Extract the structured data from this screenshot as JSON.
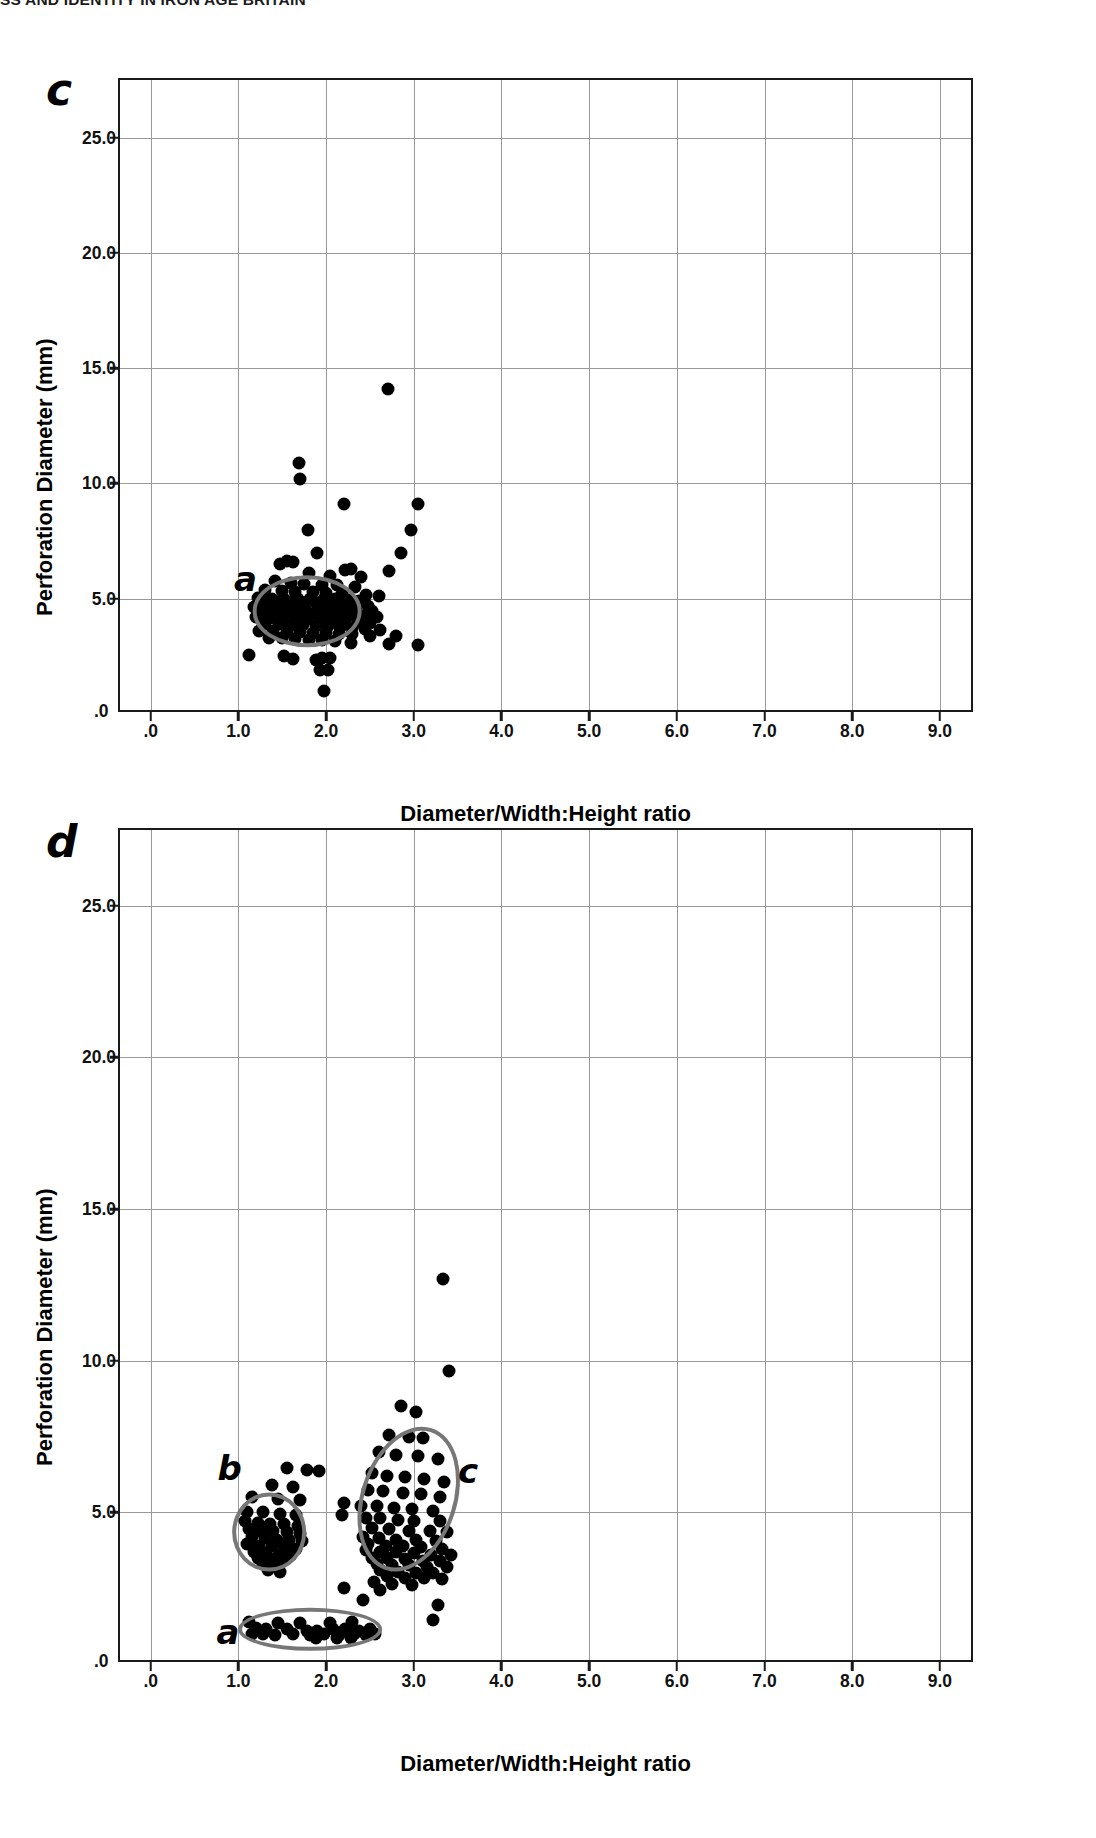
{
  "page": {
    "running_head": "SS AND IDENTITY IN IRON AGE BRITAIN"
  },
  "panels": [
    {
      "letter": "c",
      "axis": {
        "ylabel": "Perforation Diameter (mm)",
        "xlabel": "Diameter/Width:Height ratio",
        "yticks": [
          "25.0",
          "20.0",
          "15.0",
          "10.0",
          "5.0"
        ],
        "ytick_values": [
          25.0,
          20.0,
          15.0,
          10.0,
          5.0
        ],
        "yorigin_label": ".0",
        "xticks": [
          ".0",
          "1.0",
          "2.0",
          "3.0",
          "4.0",
          "5.0",
          "6.0",
          "7.0",
          "8.0",
          "9.0"
        ],
        "xtick_values": [
          0,
          1,
          2,
          3,
          4,
          5,
          6,
          7,
          8,
          9
        ]
      },
      "clusters": [
        {
          "label": "a",
          "cx": 1.78,
          "cy": 4.45,
          "rx": 0.62,
          "ry": 1.55,
          "rot": 0,
          "label_x": 1.08,
          "label_y": 5.85
        }
      ]
    },
    {
      "letter": "d",
      "axis": {
        "ylabel": "Perforation Diameter (mm)",
        "xlabel": "Diameter/Width:Height ratio",
        "yticks": [
          "25.0",
          "20.0",
          "15.0",
          "10.0",
          "5.0"
        ],
        "ytick_values": [
          25.0,
          20.0,
          15.0,
          10.0,
          5.0
        ],
        "yorigin_label": ".0",
        "xticks": [
          ".0",
          "1.0",
          "2.0",
          "3.0",
          "4.0",
          "5.0",
          "6.0",
          "7.0",
          "8.0",
          "9.0"
        ],
        "xtick_values": [
          0,
          1,
          2,
          3,
          4,
          5,
          6,
          7,
          8,
          9
        ]
      },
      "clusters": [
        {
          "label": "b",
          "cx": 1.35,
          "cy": 4.35,
          "rx": 0.42,
          "ry": 1.3,
          "rot": 0,
          "label_x": 0.9,
          "label_y": 6.45
        },
        {
          "label": "c",
          "cx": 2.95,
          "cy": 5.45,
          "rx": 0.55,
          "ry": 2.45,
          "rot": 18,
          "label_x": 3.62,
          "label_y": 6.35
        },
        {
          "label": "a",
          "cx": 1.82,
          "cy": 1.15,
          "rx": 0.82,
          "ry": 0.7,
          "rot": 0,
          "label_x": 0.88,
          "label_y": 1.05
        }
      ]
    }
  ],
  "chart_data": [
    {
      "type": "scatter",
      "panel": "c",
      "title": "",
      "xlabel": "Diameter/Width:Height ratio",
      "ylabel": "Perforation Diameter (mm)",
      "xlim": [
        -0.35,
        9.4
      ],
      "ylim": [
        0,
        27.5
      ],
      "grid": true,
      "legend": null,
      "annotations": [
        {
          "text": "a",
          "x": 1.08,
          "y": 5.85,
          "note": "ellipse around main cluster"
        }
      ],
      "points": [
        [
          2.71,
          14.1
        ],
        [
          1.69,
          10.9
        ],
        [
          1.7,
          10.2
        ],
        [
          2.2,
          9.1
        ],
        [
          3.05,
          9.1
        ],
        [
          1.79,
          8.0
        ],
        [
          2.97,
          8.0
        ],
        [
          1.9,
          7.0
        ],
        [
          2.85,
          7.0
        ],
        [
          1.55,
          6.65
        ],
        [
          1.62,
          6.6
        ],
        [
          1.48,
          6.5
        ],
        [
          2.28,
          6.3
        ],
        [
          2.22,
          6.25
        ],
        [
          2.72,
          6.2
        ],
        [
          1.8,
          6.1
        ],
        [
          2.05,
          6.0
        ],
        [
          2.4,
          5.95
        ],
        [
          1.42,
          5.75
        ],
        [
          1.6,
          5.7
        ],
        [
          1.75,
          5.65
        ],
        [
          1.95,
          5.6
        ],
        [
          2.12,
          5.6
        ],
        [
          2.33,
          5.5
        ],
        [
          1.3,
          5.4
        ],
        [
          1.5,
          5.35
        ],
        [
          1.65,
          5.3
        ],
        [
          1.85,
          5.3
        ],
        [
          2.0,
          5.25
        ],
        [
          2.18,
          5.2
        ],
        [
          2.45,
          5.15
        ],
        [
          2.6,
          5.1
        ],
        [
          1.22,
          5.05
        ],
        [
          1.38,
          5.0
        ],
        [
          1.52,
          5.0
        ],
        [
          1.68,
          5.0
        ],
        [
          1.82,
          5.0
        ],
        [
          1.98,
          5.0
        ],
        [
          2.1,
          5.0
        ],
        [
          2.26,
          4.95
        ],
        [
          2.38,
          4.9
        ],
        [
          1.28,
          4.9
        ],
        [
          1.44,
          4.85
        ],
        [
          1.58,
          4.85
        ],
        [
          1.72,
          4.8
        ],
        [
          1.88,
          4.8
        ],
        [
          2.02,
          4.8
        ],
        [
          2.16,
          4.75
        ],
        [
          2.3,
          4.7
        ],
        [
          2.48,
          4.7
        ],
        [
          1.18,
          4.65
        ],
        [
          1.34,
          4.6
        ],
        [
          1.48,
          4.6
        ],
        [
          1.62,
          4.6
        ],
        [
          1.76,
          4.55
        ],
        [
          1.92,
          4.55
        ],
        [
          2.06,
          4.5
        ],
        [
          2.2,
          4.5
        ],
        [
          2.34,
          4.5
        ],
        [
          2.52,
          4.45
        ],
        [
          1.26,
          4.4
        ],
        [
          1.4,
          4.4
        ],
        [
          1.54,
          4.4
        ],
        [
          1.7,
          4.35
        ],
        [
          1.84,
          4.35
        ],
        [
          1.98,
          4.3
        ],
        [
          2.12,
          4.3
        ],
        [
          2.26,
          4.3
        ],
        [
          2.42,
          4.25
        ],
        [
          2.58,
          4.2
        ],
        [
          1.2,
          4.2
        ],
        [
          1.36,
          4.15
        ],
        [
          1.5,
          4.15
        ],
        [
          1.64,
          4.1
        ],
        [
          1.78,
          4.1
        ],
        [
          1.94,
          4.05
        ],
        [
          2.08,
          4.05
        ],
        [
          2.22,
          4.0
        ],
        [
          2.36,
          4.0
        ],
        [
          2.5,
          3.95
        ],
        [
          1.3,
          3.9
        ],
        [
          1.46,
          3.9
        ],
        [
          1.6,
          3.85
        ],
        [
          1.74,
          3.85
        ],
        [
          1.88,
          3.8
        ],
        [
          2.02,
          3.8
        ],
        [
          2.16,
          3.75
        ],
        [
          2.3,
          3.75
        ],
        [
          2.44,
          3.7
        ],
        [
          2.62,
          3.65
        ],
        [
          1.24,
          3.6
        ],
        [
          1.4,
          3.6
        ],
        [
          1.55,
          3.55
        ],
        [
          1.7,
          3.55
        ],
        [
          1.85,
          3.5
        ],
        [
          2.0,
          3.5
        ],
        [
          2.15,
          3.45
        ],
        [
          2.3,
          3.45
        ],
        [
          2.5,
          3.4
        ],
        [
          2.8,
          3.4
        ],
        [
          1.35,
          3.3
        ],
        [
          1.5,
          3.3
        ],
        [
          1.65,
          3.25
        ],
        [
          1.8,
          3.2
        ],
        [
          1.95,
          3.2
        ],
        [
          2.1,
          3.15
        ],
        [
          2.28,
          3.1
        ],
        [
          2.72,
          3.05
        ],
        [
          3.05,
          3.0
        ],
        [
          1.12,
          2.55
        ],
        [
          1.52,
          2.5
        ],
        [
          1.95,
          2.45
        ],
        [
          2.05,
          2.45
        ],
        [
          1.62,
          2.4
        ],
        [
          1.88,
          2.35
        ],
        [
          1.93,
          1.9
        ],
        [
          2.02,
          1.9
        ],
        [
          1.98,
          1.0
        ]
      ]
    },
    {
      "type": "scatter",
      "panel": "d",
      "title": "",
      "xlabel": "Diameter/Width:Height ratio",
      "ylabel": "Perforation Diameter (mm)",
      "xlim": [
        -0.35,
        9.4
      ],
      "ylim": [
        0,
        27.5
      ],
      "grid": true,
      "legend": null,
      "annotations": [
        {
          "text": "b",
          "x": 0.9,
          "y": 6.45,
          "note": "small left cluster ellipse"
        },
        {
          "text": "c",
          "x": 3.62,
          "y": 6.35,
          "note": "tilted right cluster ellipse"
        },
        {
          "text": "a",
          "x": 0.88,
          "y": 1.05,
          "note": "flat low-y cluster ellipse"
        }
      ],
      "points": [
        [
          3.33,
          12.7
        ],
        [
          3.4,
          9.65
        ],
        [
          2.85,
          8.5
        ],
        [
          3.02,
          8.3
        ],
        [
          2.72,
          7.55
        ],
        [
          2.95,
          7.5
        ],
        [
          3.1,
          7.45
        ],
        [
          2.6,
          7.0
        ],
        [
          2.8,
          6.9
        ],
        [
          3.05,
          6.85
        ],
        [
          3.28,
          6.75
        ],
        [
          1.55,
          6.45
        ],
        [
          1.78,
          6.4
        ],
        [
          1.92,
          6.35
        ],
        [
          2.52,
          6.3
        ],
        [
          2.7,
          6.2
        ],
        [
          2.9,
          6.15
        ],
        [
          3.12,
          6.1
        ],
        [
          3.35,
          6.0
        ],
        [
          1.38,
          5.9
        ],
        [
          1.62,
          5.85
        ],
        [
          2.48,
          5.75
        ],
        [
          2.65,
          5.7
        ],
        [
          2.88,
          5.65
        ],
        [
          3.08,
          5.6
        ],
        [
          3.3,
          5.5
        ],
        [
          1.15,
          5.5
        ],
        [
          1.45,
          5.45
        ],
        [
          1.7,
          5.4
        ],
        [
          2.2,
          5.3
        ],
        [
          2.4,
          5.2
        ],
        [
          2.58,
          5.2
        ],
        [
          2.78,
          5.15
        ],
        [
          2.98,
          5.1
        ],
        [
          3.22,
          5.05
        ],
        [
          1.1,
          5.0
        ],
        [
          1.28,
          5.0
        ],
        [
          1.48,
          4.95
        ],
        [
          1.66,
          4.9
        ],
        [
          2.18,
          4.9
        ],
        [
          2.45,
          4.8
        ],
        [
          2.62,
          4.8
        ],
        [
          2.82,
          4.75
        ],
        [
          3.0,
          4.7
        ],
        [
          3.3,
          4.7
        ],
        [
          1.08,
          4.7
        ],
        [
          1.22,
          4.65
        ],
        [
          1.36,
          4.6
        ],
        [
          1.52,
          4.6
        ],
        [
          1.68,
          4.55
        ],
        [
          2.52,
          4.5
        ],
        [
          2.72,
          4.45
        ],
        [
          2.95,
          4.4
        ],
        [
          3.18,
          4.4
        ],
        [
          3.38,
          4.35
        ],
        [
          1.12,
          4.45
        ],
        [
          1.26,
          4.4
        ],
        [
          1.4,
          4.4
        ],
        [
          1.55,
          4.35
        ],
        [
          1.7,
          4.3
        ],
        [
          2.42,
          4.2
        ],
        [
          2.6,
          4.15
        ],
        [
          2.8,
          4.1
        ],
        [
          3.02,
          4.1
        ],
        [
          3.25,
          4.05
        ],
        [
          1.16,
          4.2
        ],
        [
          1.3,
          4.15
        ],
        [
          1.44,
          4.1
        ],
        [
          1.58,
          4.1
        ],
        [
          1.72,
          4.05
        ],
        [
          2.48,
          3.95
        ],
        [
          2.68,
          3.9
        ],
        [
          2.88,
          3.9
        ],
        [
          3.08,
          3.85
        ],
        [
          3.32,
          3.8
        ],
        [
          1.1,
          3.95
        ],
        [
          1.24,
          3.9
        ],
        [
          1.38,
          3.9
        ],
        [
          1.52,
          3.85
        ],
        [
          1.66,
          3.8
        ],
        [
          2.45,
          3.75
        ],
        [
          2.62,
          3.7
        ],
        [
          2.8,
          3.7
        ],
        [
          3.0,
          3.65
        ],
        [
          3.2,
          3.6
        ],
        [
          3.42,
          3.6
        ],
        [
          1.18,
          3.7
        ],
        [
          1.32,
          3.65
        ],
        [
          1.46,
          3.6
        ],
        [
          1.6,
          3.6
        ],
        [
          2.52,
          3.5
        ],
        [
          2.7,
          3.5
        ],
        [
          2.9,
          3.45
        ],
        [
          3.1,
          3.4
        ],
        [
          3.3,
          3.4
        ],
        [
          1.22,
          3.5
        ],
        [
          1.36,
          3.45
        ],
        [
          1.5,
          3.4
        ],
        [
          2.58,
          3.3
        ],
        [
          2.75,
          3.25
        ],
        [
          2.95,
          3.25
        ],
        [
          3.15,
          3.2
        ],
        [
          3.38,
          3.2
        ],
        [
          1.28,
          3.3
        ],
        [
          1.42,
          3.25
        ],
        [
          2.62,
          3.1
        ],
        [
          2.82,
          3.05
        ],
        [
          3.02,
          3.0
        ],
        [
          3.22,
          3.0
        ],
        [
          1.34,
          3.1
        ],
        [
          1.48,
          3.05
        ],
        [
          2.7,
          2.9
        ],
        [
          2.9,
          2.85
        ],
        [
          3.12,
          2.85
        ],
        [
          3.32,
          2.8
        ],
        [
          2.55,
          2.7
        ],
        [
          2.75,
          2.65
        ],
        [
          2.98,
          2.6
        ],
        [
          2.2,
          2.5
        ],
        [
          2.62,
          2.45
        ],
        [
          2.42,
          2.1
        ],
        [
          3.28,
          1.95
        ],
        [
          3.22,
          1.45
        ],
        [
          1.12,
          1.4
        ],
        [
          1.45,
          1.35
        ],
        [
          1.7,
          1.35
        ],
        [
          2.05,
          1.35
        ],
        [
          2.3,
          1.4
        ],
        [
          1.2,
          1.2
        ],
        [
          1.32,
          1.15
        ],
        [
          1.55,
          1.15
        ],
        [
          1.78,
          1.1
        ],
        [
          1.9,
          1.1
        ],
        [
          2.08,
          1.15
        ],
        [
          2.22,
          1.15
        ],
        [
          2.38,
          1.1
        ],
        [
          2.5,
          1.15
        ],
        [
          1.15,
          1.0
        ],
        [
          1.28,
          1.0
        ],
        [
          1.42,
          0.95
        ],
        [
          1.62,
          1.0
        ],
        [
          1.82,
          0.95
        ],
        [
          1.98,
          1.0
        ],
        [
          2.15,
          0.95
        ],
        [
          2.32,
          1.0
        ],
        [
          2.45,
          0.95
        ],
        [
          2.56,
          1.0
        ],
        [
          2.28,
          0.85
        ],
        [
          1.88,
          0.85
        ],
        [
          2.12,
          0.85
        ]
      ]
    }
  ]
}
